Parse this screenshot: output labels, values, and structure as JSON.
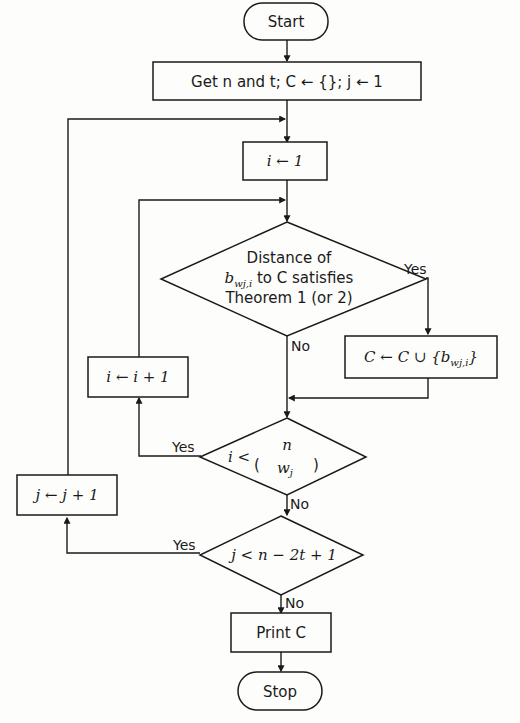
{
  "diagram": {
    "type": "flowchart",
    "nodes": {
      "start": {
        "label": "Start"
      },
      "init": {
        "label": "Get n and t; C ← {}; j ← 1"
      },
      "i_init": {
        "label": "i ← 1"
      },
      "check_distance": {
        "line1": "Distance of",
        "line2": "b_{w_j,i} to C satisfies",
        "line2_var": "b",
        "line2_sub": "wj,i",
        "line2_rest": " to C satisfies",
        "line3": "Theorem 1 (or 2)"
      },
      "add_to_c": {
        "label": "C ← C ∪ {b_{w_j,i}}",
        "prefix": "C ← C ∪ {b",
        "sub": "wj,i",
        "suffix": "}"
      },
      "i_inc": {
        "label": "i ← i + 1"
      },
      "check_i": {
        "label": "i < (n choose w_j)",
        "lhs": "i <",
        "top": "n",
        "bottom": "w",
        "bottom_sub": "j"
      },
      "j_inc": {
        "label": "j ← j + 1"
      },
      "check_j": {
        "label": "j < n − 2t + 1"
      },
      "print": {
        "label": "Print C"
      },
      "stop": {
        "label": "Stop"
      }
    },
    "edge_labels": {
      "distance_yes": "Yes",
      "distance_no": "No",
      "check_i_yes": "Yes",
      "check_i_no": "No",
      "check_j_yes": "Yes",
      "check_j_no": "No"
    },
    "colors": {
      "line": "#1a1a1a",
      "background": "#fdfdfb"
    }
  }
}
